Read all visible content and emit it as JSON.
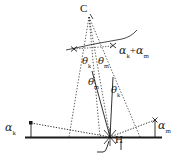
{
  "figure": {
    "type": "geometry-diagram",
    "background_color": "#ffffff",
    "stroke_color": "#1a1a1a",
    "width": 180,
    "height": 161
  },
  "labels": {
    "apex": "C",
    "base_point": "H",
    "angle_sum": {
      "glyph": "α",
      "sub1": "k",
      "op": "+",
      "glyph2": "α",
      "sub2": "m"
    },
    "theta_k_upper": {
      "glyph": "θ",
      "sub": "k"
    },
    "theta_m_upper": {
      "glyph": "θ",
      "sub": "m"
    },
    "theta_m_lower": {
      "glyph": "θ",
      "sub": "m"
    },
    "theta_k_lower": {
      "glyph": "θ",
      "sub": "k"
    },
    "alpha_k": {
      "glyph": "α",
      "sub": "k"
    },
    "alpha_m": {
      "glyph": "α",
      "sub": "m"
    }
  },
  "geometry": {
    "apex_point": {
      "x": 89,
      "y": 16
    },
    "base_point": {
      "x": 110,
      "y": 137
    },
    "baseline": {
      "x1": 25,
      "y1": 137,
      "x2": 162,
      "y2": 137
    },
    "arc_marker_left": {
      "x": 74,
      "y": 49
    },
    "arc_marker_right": {
      "x": 113,
      "y": 46
    },
    "tick_left": {
      "x": 31,
      "y_top": 122,
      "y_bottom": 137
    },
    "tick_right": {
      "x": 155,
      "y_top": 119,
      "y_bottom": 137
    },
    "rays_from_apex": [
      {
        "to_x": 69,
        "to_y": 137
      },
      {
        "to_x": 110,
        "to_y": 137
      },
      {
        "to_x": 140,
        "to_y": 137
      }
    ],
    "rays_from_base": [
      {
        "to_x": 92,
        "to_y": 72
      },
      {
        "to_x": 113,
        "to_y": 78
      }
    ]
  }
}
